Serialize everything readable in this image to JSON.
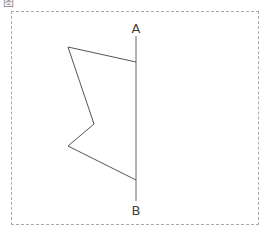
{
  "caption": "图",
  "diagram": {
    "axis_line": {
      "label_top": "A",
      "label_bottom": "B"
    },
    "polyline_points": [
      [
        136,
        62
      ],
      [
        68,
        47
      ],
      [
        94,
        124
      ],
      [
        68,
        146
      ],
      [
        136,
        180
      ]
    ],
    "colors": {
      "stroke": "#555555",
      "frame": "#aaaaaa"
    }
  }
}
